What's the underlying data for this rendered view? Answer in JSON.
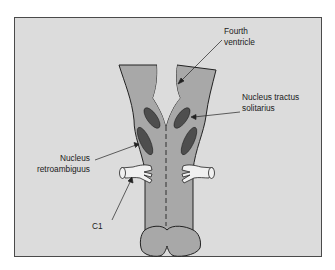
{
  "diagram": {
    "colors": {
      "background": "#dcdcdc",
      "frame_border": "#4a4a4a",
      "tissue_fill": "#a8a8a8",
      "nucleus_fill": "#4e4e4e",
      "outline": "#222222",
      "nerve_root_fill": "#f0f0f0"
    },
    "labels": {
      "fourth_ventricle": {
        "line1": "Fourth",
        "line2": "ventricle"
      },
      "nucleus_tractus_solitarius": {
        "line1": "Nucleus tractus",
        "line2": "solitarius"
      },
      "nucleus_retroambiguus": {
        "line1": "Nucleus",
        "line2": "retroambiguus"
      },
      "c1": {
        "line1": "C1"
      }
    }
  }
}
